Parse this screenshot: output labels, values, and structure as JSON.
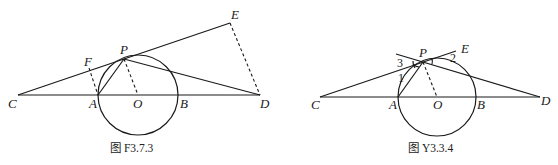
{
  "figures": [
    {
      "caption": "图 F3.7.3",
      "points": {
        "C": "C",
        "A": "A",
        "O": "O",
        "B": "B",
        "D": "D",
        "P": "P",
        "F": "F",
        "E": "E"
      },
      "description": "Circle O with diameter AB on line CD; tangent CPE at P; PD secant; dashed FA, PO, ED perpendiculars"
    },
    {
      "caption": "图 Y3.3.4",
      "points": {
        "C": "C",
        "A": "A",
        "O": "O",
        "B": "B",
        "D": "D",
        "P": "P",
        "E": "E"
      },
      "angles": {
        "a1": "1",
        "a2": "2",
        "a3": "3"
      },
      "description": "Circle O with diameter AB on line CD; line CPE through P; PD line; dashed PO; angles 1, 2, 3 marked"
    }
  ]
}
